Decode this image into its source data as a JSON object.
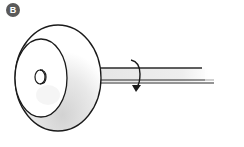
{
  "figure": {
    "label": "B",
    "badge_color": "#5a5a5a",
    "line_color": "#1a1a1a",
    "shading_color": "#d8d8d8",
    "components": [
      {
        "name": "wheel",
        "description": "disc/wheel seen in perspective"
      },
      {
        "name": "inner-face",
        "description": "front face ellipse of wheel"
      },
      {
        "name": "hub",
        "description": "small cylindrical hub at wheel center"
      },
      {
        "name": "shaft",
        "description": "axle extending to the right"
      },
      {
        "name": "rotation-arrow",
        "description": "curved arrow indicating shaft rotation"
      }
    ]
  }
}
